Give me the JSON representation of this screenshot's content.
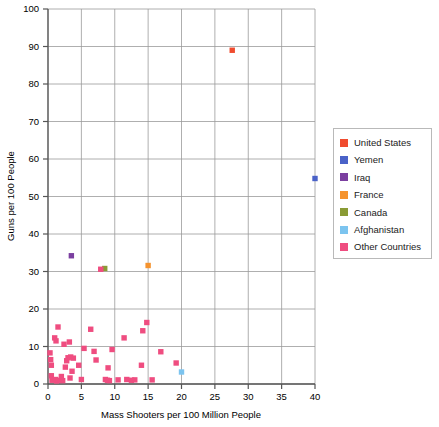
{
  "chart_data": {
    "type": "scatter",
    "title": "",
    "xlabel": "Mass Shooters per 100 Million People",
    "ylabel": "Guns per 100 People",
    "xlim": [
      0,
      40
    ],
    "ylim": [
      0,
      100
    ],
    "xticks": [
      0,
      5,
      10,
      15,
      20,
      25,
      30,
      35,
      40
    ],
    "yticks": [
      0,
      10,
      20,
      30,
      40,
      50,
      60,
      70,
      80,
      90,
      100
    ],
    "grid": true,
    "legend_position": "right",
    "series": [
      {
        "name": "United States",
        "color": "#f04b2e",
        "points": [
          [
            27.6,
            89.0
          ]
        ]
      },
      {
        "name": "Yemen",
        "color": "#4a62c8",
        "points": [
          [
            40.0,
            54.8
          ]
        ]
      },
      {
        "name": "Iraq",
        "color": "#7b3fa0",
        "points": [
          [
            3.5,
            34.2
          ]
        ]
      },
      {
        "name": "France",
        "color": "#f5932e",
        "points": [
          [
            15.0,
            31.6
          ]
        ]
      },
      {
        "name": "Canada",
        "color": "#8a9b35",
        "points": [
          [
            8.5,
            30.8
          ]
        ]
      },
      {
        "name": "Afghanistan",
        "color": "#7cc4ef",
        "points": [
          [
            20.0,
            3.2
          ]
        ]
      },
      {
        "name": "Other Countries",
        "color": "#ef4d80",
        "points": [
          [
            1.5,
            15.2
          ],
          [
            7.9,
            30.6
          ],
          [
            1.0,
            12.3
          ],
          [
            1.2,
            11.5
          ],
          [
            2.4,
            10.6
          ],
          [
            3.2,
            11.2
          ],
          [
            0.3,
            8.3
          ],
          [
            0.4,
            6.5
          ],
          [
            0.5,
            5.0
          ],
          [
            0.5,
            2.2
          ],
          [
            0.6,
            1.0
          ],
          [
            1.1,
            1.2
          ],
          [
            1.3,
            0.8
          ],
          [
            1.6,
            1.0
          ],
          [
            2.0,
            2.0
          ],
          [
            2.6,
            4.5
          ],
          [
            2.8,
            6.2
          ],
          [
            3.0,
            7.0
          ],
          [
            3.4,
            7.2
          ],
          [
            3.8,
            6.9
          ],
          [
            3.6,
            3.4
          ],
          [
            3.3,
            1.6
          ],
          [
            2.2,
            0.9
          ],
          [
            4.6,
            5.0
          ],
          [
            5.0,
            1.2
          ],
          [
            5.4,
            9.5
          ],
          [
            6.4,
            14.6
          ],
          [
            6.9,
            8.7
          ],
          [
            7.2,
            6.4
          ],
          [
            8.6,
            1.2
          ],
          [
            8.9,
            1.0
          ],
          [
            9.2,
            0.9
          ],
          [
            9.0,
            4.3
          ],
          [
            9.6,
            9.2
          ],
          [
            10.5,
            1.1
          ],
          [
            11.4,
            12.3
          ],
          [
            11.8,
            1.2
          ],
          [
            12.5,
            1.0
          ],
          [
            13.0,
            1.1
          ],
          [
            14.2,
            14.2
          ],
          [
            14.8,
            16.4
          ],
          [
            14.0,
            5.0
          ],
          [
            15.6,
            1.1
          ],
          [
            16.9,
            8.6
          ],
          [
            19.2,
            5.6
          ]
        ]
      }
    ]
  },
  "legend": {
    "items": [
      {
        "label": "United States",
        "color": "#f04b2e"
      },
      {
        "label": "Yemen",
        "color": "#4a62c8"
      },
      {
        "label": "Iraq",
        "color": "#7b3fa0"
      },
      {
        "label": "France",
        "color": "#f5932e"
      },
      {
        "label": "Canada",
        "color": "#8a9b35"
      },
      {
        "label": "Afghanistan",
        "color": "#7cc4ef"
      },
      {
        "label": "Other Countries",
        "color": "#ef4d80"
      }
    ]
  }
}
